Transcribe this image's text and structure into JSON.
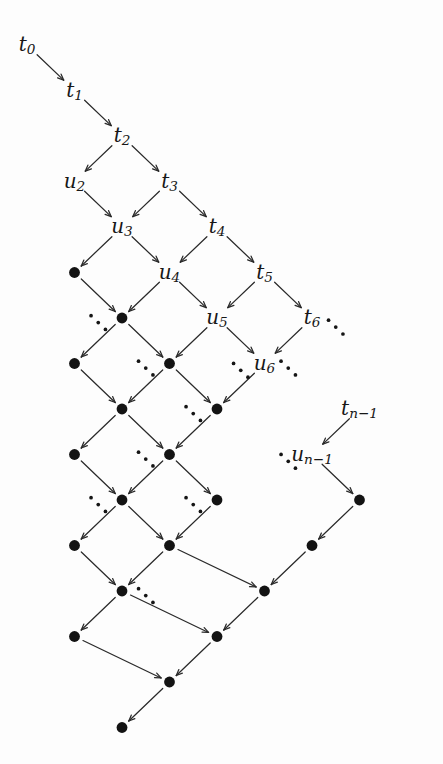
{
  "figure": {
    "kind": "lattice-diagram",
    "title": "",
    "width": 443,
    "height": 764,
    "background": "#fdfdfd",
    "ink_color": "#171717",
    "edge_color": "#2a2a2a",
    "dot_color": "#131313"
  },
  "geometry": {
    "origin_x": 27,
    "origin_y": 45,
    "step_x": 47.5,
    "step_y": 45.5,
    "dot_radius": 5.4,
    "label_font_size": 20,
    "arrow_head": 6.5,
    "edge_gap_start": 11,
    "edge_gap_end": 11
  },
  "nodes": [
    {
      "id": "t0",
      "col": 0,
      "row": 0,
      "type": "label",
      "text": "t",
      "sub": "0"
    },
    {
      "id": "t1",
      "col": 1,
      "row": 1,
      "type": "label",
      "text": "t",
      "sub": "1"
    },
    {
      "id": "t2",
      "col": 2,
      "row": 2,
      "type": "label",
      "text": "t",
      "sub": "2"
    },
    {
      "id": "u2",
      "col": 1,
      "row": 3,
      "type": "label",
      "text": "u",
      "sub": "2"
    },
    {
      "id": "t3",
      "col": 3,
      "row": 3,
      "type": "label",
      "text": "t",
      "sub": "3"
    },
    {
      "id": "u3",
      "col": 2,
      "row": 4,
      "type": "label",
      "text": "u",
      "sub": "3"
    },
    {
      "id": "t4",
      "col": 4,
      "row": 4,
      "type": "label",
      "text": "t",
      "sub": "4"
    },
    {
      "id": "d15",
      "col": 1,
      "row": 5,
      "type": "dot"
    },
    {
      "id": "u4",
      "col": 3,
      "row": 5,
      "type": "label",
      "text": "u",
      "sub": "4"
    },
    {
      "id": "t5",
      "col": 5,
      "row": 5,
      "type": "label",
      "text": "t",
      "sub": "5"
    },
    {
      "id": "d26",
      "col": 2,
      "row": 6,
      "type": "dot"
    },
    {
      "id": "u5",
      "col": 4,
      "row": 6,
      "type": "label",
      "text": "u",
      "sub": "5"
    },
    {
      "id": "t6",
      "col": 6,
      "row": 6,
      "type": "label",
      "text": "t",
      "sub": "6"
    },
    {
      "id": "d17",
      "col": 1,
      "row": 7,
      "type": "dot"
    },
    {
      "id": "d37",
      "col": 3,
      "row": 7,
      "type": "dot"
    },
    {
      "id": "u6",
      "col": 5,
      "row": 7,
      "type": "label",
      "text": "u",
      "sub": "6"
    },
    {
      "id": "d28",
      "col": 2,
      "row": 8,
      "type": "dot"
    },
    {
      "id": "d48",
      "col": 4,
      "row": 8,
      "type": "dot"
    },
    {
      "id": "tn1",
      "col": 7,
      "row": 8,
      "type": "label",
      "text": "t",
      "sub": "n−1"
    },
    {
      "id": "d19",
      "col": 1,
      "row": 9,
      "type": "dot"
    },
    {
      "id": "d39",
      "col": 3,
      "row": 9,
      "type": "dot"
    },
    {
      "id": "un1",
      "col": 6,
      "row": 9,
      "type": "label",
      "text": "u",
      "sub": "n−1"
    },
    {
      "id": "d210",
      "col": 2,
      "row": 10,
      "type": "dot"
    },
    {
      "id": "d410",
      "col": 4,
      "row": 10,
      "type": "dot"
    },
    {
      "id": "d710",
      "col": 7,
      "row": 10,
      "type": "dot"
    },
    {
      "id": "d111",
      "col": 1,
      "row": 11,
      "type": "dot"
    },
    {
      "id": "d311",
      "col": 3,
      "row": 11,
      "type": "dot"
    },
    {
      "id": "d611",
      "col": 6,
      "row": 11,
      "type": "dot"
    },
    {
      "id": "d212",
      "col": 2,
      "row": 12,
      "type": "dot"
    },
    {
      "id": "d512",
      "col": 5,
      "row": 12,
      "type": "dot"
    },
    {
      "id": "d113",
      "col": 1,
      "row": 13,
      "type": "dot"
    },
    {
      "id": "d413",
      "col": 4,
      "row": 13,
      "type": "dot"
    },
    {
      "id": "d314",
      "col": 3,
      "row": 14,
      "type": "dot"
    },
    {
      "id": "d215",
      "col": 2,
      "row": 15,
      "type": "dot"
    }
  ],
  "edges": [
    {
      "from": "t0",
      "to": "t1"
    },
    {
      "from": "t1",
      "to": "t2"
    },
    {
      "from": "t2",
      "to": "u2"
    },
    {
      "from": "t2",
      "to": "t3"
    },
    {
      "from": "u2",
      "to": "u3"
    },
    {
      "from": "t3",
      "to": "u3"
    },
    {
      "from": "t3",
      "to": "t4"
    },
    {
      "from": "u3",
      "to": "d15"
    },
    {
      "from": "u3",
      "to": "u4"
    },
    {
      "from": "t4",
      "to": "u4"
    },
    {
      "from": "t4",
      "to": "t5"
    },
    {
      "from": "d15",
      "to": "d26"
    },
    {
      "from": "u4",
      "to": "d26"
    },
    {
      "from": "u4",
      "to": "u5"
    },
    {
      "from": "t5",
      "to": "u5"
    },
    {
      "from": "t5",
      "to": "t6"
    },
    {
      "from": "d26",
      "to": "d17"
    },
    {
      "from": "d26",
      "to": "d37"
    },
    {
      "from": "u5",
      "to": "d37"
    },
    {
      "from": "u5",
      "to": "u6"
    },
    {
      "from": "t6",
      "to": "u6"
    },
    {
      "from": "d17",
      "to": "d28"
    },
    {
      "from": "d37",
      "to": "d28"
    },
    {
      "from": "d37",
      "to": "d48"
    },
    {
      "from": "u6",
      "to": "d48"
    },
    {
      "from": "d28",
      "to": "d19"
    },
    {
      "from": "d28",
      "to": "d39"
    },
    {
      "from": "d48",
      "to": "d39"
    },
    {
      "from": "tn1",
      "to": "un1"
    },
    {
      "from": "d19",
      "to": "d210"
    },
    {
      "from": "d39",
      "to": "d210"
    },
    {
      "from": "d39",
      "to": "d410"
    },
    {
      "from": "un1",
      "to": "d710"
    },
    {
      "from": "d210",
      "to": "d111"
    },
    {
      "from": "d210",
      "to": "d311"
    },
    {
      "from": "d410",
      "to": "d311"
    },
    {
      "from": "d710",
      "to": "d611"
    },
    {
      "from": "d111",
      "to": "d212"
    },
    {
      "from": "d311",
      "to": "d212"
    },
    {
      "from": "d311",
      "to": "d512"
    },
    {
      "from": "d611",
      "to": "d512"
    },
    {
      "from": "d212",
      "to": "d113"
    },
    {
      "from": "d212",
      "to": "d413"
    },
    {
      "from": "d512",
      "to": "d413"
    },
    {
      "from": "d113",
      "to": "d314"
    },
    {
      "from": "d413",
      "to": "d314"
    },
    {
      "from": "d314",
      "to": "d215"
    }
  ],
  "ellipses": [
    {
      "id": "e1",
      "col": 1.5,
      "row": 6.1,
      "dir": "dr"
    },
    {
      "id": "e2",
      "col": 2.5,
      "row": 7.1,
      "dir": "dr"
    },
    {
      "id": "e3",
      "col": 5.5,
      "row": 7.1,
      "dir": "dr"
    },
    {
      "id": "e4",
      "col": 6.5,
      "row": 6.2,
      "dir": "dr"
    },
    {
      "id": "e5",
      "col": 3.5,
      "row": 8.1,
      "dir": "dr"
    },
    {
      "id": "e6",
      "col": 4.5,
      "row": 7.15,
      "dir": "dr"
    },
    {
      "id": "e7",
      "col": 2.5,
      "row": 9.1,
      "dir": "dr"
    },
    {
      "id": "e8",
      "col": 5.5,
      "row": 9.15,
      "dir": "dr"
    },
    {
      "id": "e9",
      "col": 3.5,
      "row": 10.1,
      "dir": "dr"
    },
    {
      "id": "e10",
      "col": 1.5,
      "row": 10.1,
      "dir": "dr"
    },
    {
      "id": "e11",
      "col": 2.5,
      "row": 12.1,
      "dir": "dr"
    }
  ],
  "legend": {
    "sequence_t": [
      "t0",
      "t1",
      "t2",
      "t3",
      "t4",
      "t5",
      "t6",
      "t_{n-1}"
    ],
    "sequence_u": [
      "u2",
      "u3",
      "u4",
      "u5",
      "u6",
      "u_{n-1}"
    ]
  }
}
